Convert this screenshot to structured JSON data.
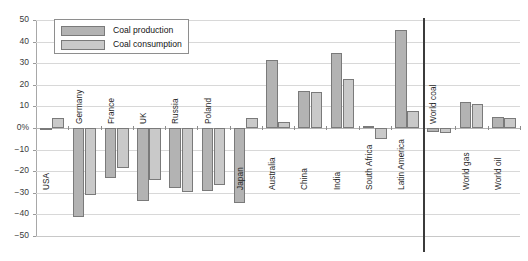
{
  "chart_data": {
    "type": "bar",
    "title": "",
    "subtitle": "",
    "xlabel": "",
    "ylabel": "",
    "ylim": [
      -50,
      50
    ],
    "ytick_labels": [
      "50",
      "40",
      "30",
      "20",
      "10",
      "0%",
      "−10",
      "−20",
      "−30",
      "−40",
      "−50"
    ],
    "ytick_values": [
      50,
      40,
      30,
      20,
      10,
      0,
      -10,
      -20,
      -30,
      -40,
      -50
    ],
    "grid": true,
    "legend_position": "upper-left",
    "categories": [
      "USA",
      "Germany",
      "France",
      "UK",
      "Russia",
      "Poland",
      "Japan",
      "Australia",
      "China",
      "India",
      "South Africa",
      "Latin America",
      "World coal",
      "World gas",
      "World oil"
    ],
    "series": [
      {
        "name": "Coal production",
        "color": "#b3b3b3",
        "values": [
          -1.0,
          -41.0,
          -23.0,
          -34.0,
          -28.0,
          -29.0,
          -34.5,
          31.5,
          17.0,
          34.5,
          1.0,
          45.5,
          -2.0,
          12.0,
          5.0
        ]
      },
      {
        "name": "Coal consumption",
        "color": "#c9c9c9",
        "values": [
          4.5,
          -31.0,
          -18.5,
          -24.0,
          -29.5,
          -26.5,
          4.5,
          3.0,
          16.8,
          22.5,
          -5.0,
          8.0,
          -2.5,
          11.0,
          4.5
        ]
      }
    ],
    "separator_after_category": "Latin America"
  },
  "legend": {
    "items": [
      {
        "label": "Coal production"
      },
      {
        "label": "Coal consumption"
      }
    ]
  }
}
